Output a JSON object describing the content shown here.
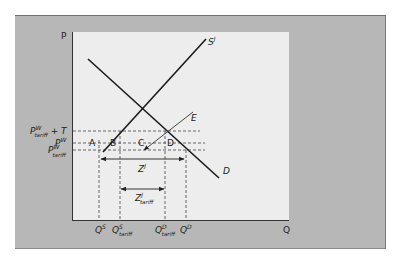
{
  "diagram": {
    "type": "supply-demand",
    "axes": {
      "y_label": "P",
      "x_label": "Q"
    },
    "curves": {
      "supply": "S",
      "supply_sup": "J",
      "demand": "D",
      "excess": "E"
    },
    "price_levels": {
      "p_tariff_plus_t": {
        "main": "P",
        "sup": "W",
        "sub": "tariff",
        "suffix": "+ T"
      },
      "p_world": {
        "main": "P",
        "sup": "W"
      },
      "p_tariff": {
        "main": "P",
        "sup": "W",
        "sub": "tariff"
      }
    },
    "areas": [
      "A",
      "B",
      "C",
      "D"
    ],
    "imports": {
      "free_trade": {
        "main": "Z",
        "sup": "J"
      },
      "tariff": {
        "main": "Z",
        "sup": "J",
        "sub": "tariff"
      }
    },
    "quantities": {
      "qs": {
        "main": "Q",
        "sup": "S"
      },
      "qs_tariff": {
        "main": "Q",
        "sup": "S",
        "sub": "tariff"
      },
      "qd_tariff": {
        "main": "Q",
        "sup": "D",
        "sub": "tariff"
      },
      "qd": {
        "main": "Q",
        "sup": "D"
      }
    }
  }
}
